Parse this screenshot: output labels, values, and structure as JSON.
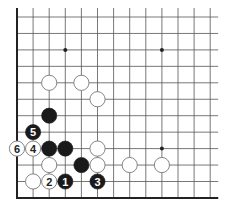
{
  "diagram": {
    "type": "go-board-fragment",
    "grid": {
      "columns": 13,
      "rows": 12,
      "origin_x": 17,
      "origin_y": 17,
      "spacing_x": 16.1,
      "spacing_y": 16.45,
      "left_edge": true,
      "bottom_edge": true,
      "top_edge": false,
      "right_edge": false
    },
    "colors": {
      "line": "#555555",
      "edge": "#222222",
      "black_stone": "#1a1a1a",
      "white_stone": "#ffffff",
      "white_stone_stroke": "#777777",
      "label_on_black": "#ffffff",
      "label_on_white": "#222222"
    },
    "hoshi": [
      {
        "col": 3,
        "row": 2
      },
      {
        "col": 9,
        "row": 2
      },
      {
        "col": 9,
        "row": 8
      }
    ],
    "stones": [
      {
        "color": "white",
        "col": 2,
        "row": 4,
        "label": ""
      },
      {
        "color": "white",
        "col": 4,
        "row": 4,
        "label": ""
      },
      {
        "color": "white",
        "col": 5,
        "row": 5,
        "label": ""
      },
      {
        "color": "black",
        "col": 2,
        "row": 6,
        "label": ""
      },
      {
        "color": "black",
        "col": 1,
        "row": 7,
        "label": "5"
      },
      {
        "color": "white",
        "col": 0,
        "row": 8,
        "label": "6"
      },
      {
        "color": "white",
        "col": 1,
        "row": 8,
        "label": "4"
      },
      {
        "color": "black",
        "col": 2,
        "row": 8,
        "label": ""
      },
      {
        "color": "black",
        "col": 3,
        "row": 8,
        "label": ""
      },
      {
        "color": "white",
        "col": 5,
        "row": 8,
        "label": ""
      },
      {
        "color": "white",
        "col": 2,
        "row": 9,
        "label": ""
      },
      {
        "color": "black",
        "col": 4,
        "row": 9,
        "label": ""
      },
      {
        "color": "white",
        "col": 5,
        "row": 9,
        "label": ""
      },
      {
        "color": "white",
        "col": 7,
        "row": 9,
        "label": ""
      },
      {
        "color": "white",
        "col": 9,
        "row": 9,
        "label": ""
      },
      {
        "color": "white",
        "col": 1,
        "row": 10,
        "label": ""
      },
      {
        "color": "white",
        "col": 2,
        "row": 10,
        "label": "2"
      },
      {
        "color": "black",
        "col": 3,
        "row": 10,
        "label": "1"
      },
      {
        "color": "black",
        "col": 5,
        "row": 10,
        "label": "3"
      }
    ]
  }
}
